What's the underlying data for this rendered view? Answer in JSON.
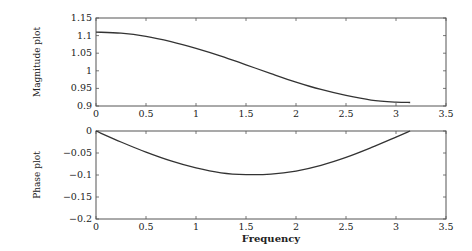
{
  "chart_data": [
    {
      "type": "line",
      "title": "",
      "xlabel": "",
      "ylabel": "Magnitude plot",
      "xlim": [
        0,
        3.5
      ],
      "ylim": [
        0.9,
        1.15
      ],
      "xticks": [
        "0",
        "0.5",
        "1",
        "1.5",
        "2",
        "2.5",
        "3",
        "3.5"
      ],
      "yticks": [
        "0.9",
        "0.95",
        "1",
        "1.05",
        "1.1",
        "1.15"
      ],
      "grid": false,
      "legend": null,
      "series": [
        {
          "name": "magnitude",
          "x": [
            0,
            0.25,
            0.5,
            0.75,
            1.0,
            1.25,
            1.5,
            1.75,
            2.0,
            2.25,
            2.5,
            2.75,
            3.0,
            3.1416
          ],
          "y": [
            1.11,
            1.107,
            1.098,
            1.083,
            1.064,
            1.042,
            1.017,
            0.992,
            0.968,
            0.947,
            0.93,
            0.917,
            0.911,
            0.91
          ]
        }
      ]
    },
    {
      "type": "line",
      "title": "",
      "xlabel": "Frequency",
      "ylabel": "Phase plot",
      "xlim": [
        0,
        3.5
      ],
      "ylim": [
        -0.2,
        0
      ],
      "xticks": [
        "0",
        "0.5",
        "1",
        "1.5",
        "2",
        "2.5",
        "3",
        "3.5"
      ],
      "yticks": [
        "-0.2",
        "-0.15",
        "-0.1",
        "-0.05",
        "0"
      ],
      "grid": false,
      "legend": null,
      "series": [
        {
          "name": "phase",
          "x": [
            0,
            0.25,
            0.5,
            0.75,
            1.0,
            1.25,
            1.5,
            1.75,
            2.0,
            2.25,
            2.5,
            2.75,
            3.0,
            3.1416
          ],
          "y": [
            0,
            -0.025,
            -0.048,
            -0.068,
            -0.084,
            -0.095,
            -0.099,
            -0.098,
            -0.091,
            -0.078,
            -0.06,
            -0.038,
            -0.014,
            0
          ]
        }
      ]
    }
  ]
}
